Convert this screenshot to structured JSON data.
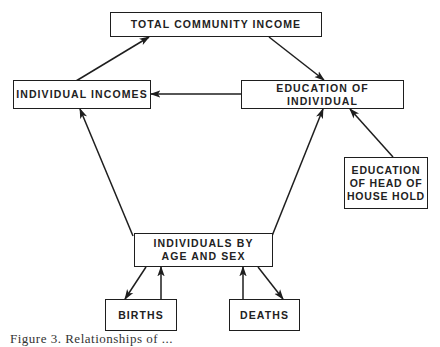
{
  "diagram": {
    "nodes": {
      "total_income": {
        "lines": [
          "TOTAL COMMUNITY INCOME"
        ]
      },
      "individual_incomes": {
        "lines": [
          "INDIVIDUAL INCOMES"
        ]
      },
      "education_individual": {
        "lines": [
          "EDUCATION OF INDIVIDUAL"
        ]
      },
      "education_head": {
        "lines": [
          "EDUCATION",
          "OF HEAD OF",
          "HOUSE HOLD"
        ]
      },
      "individuals_age_sex": {
        "lines": [
          "INDIVIDUALS BY",
          "AGE AND SEX"
        ]
      },
      "births": {
        "lines": [
          "BIRTHS"
        ]
      },
      "deaths": {
        "lines": [
          "DEATHS"
        ]
      }
    },
    "edges": [
      {
        "from": "individual_incomes",
        "to": "total_income"
      },
      {
        "from": "total_income",
        "to": "education_individual"
      },
      {
        "from": "education_individual",
        "to": "individual_incomes"
      },
      {
        "from": "education_head",
        "to": "education_individual"
      },
      {
        "from": "individuals_age_sex",
        "to": "individual_incomes"
      },
      {
        "from": "individuals_age_sex",
        "to": "education_individual"
      },
      {
        "from": "individuals_age_sex",
        "to": "births"
      },
      {
        "from": "births",
        "to": "individuals_age_sex"
      },
      {
        "from": "deaths",
        "to": "individuals_age_sex"
      },
      {
        "from": "individuals_age_sex",
        "to": "deaths"
      }
    ],
    "colors": {
      "stroke": "#1e1e1e",
      "background": "#ffffff"
    }
  },
  "caption": {
    "text": "Figure 3. Relationships of ...",
    "note": "caption clipped at bottom edge"
  }
}
